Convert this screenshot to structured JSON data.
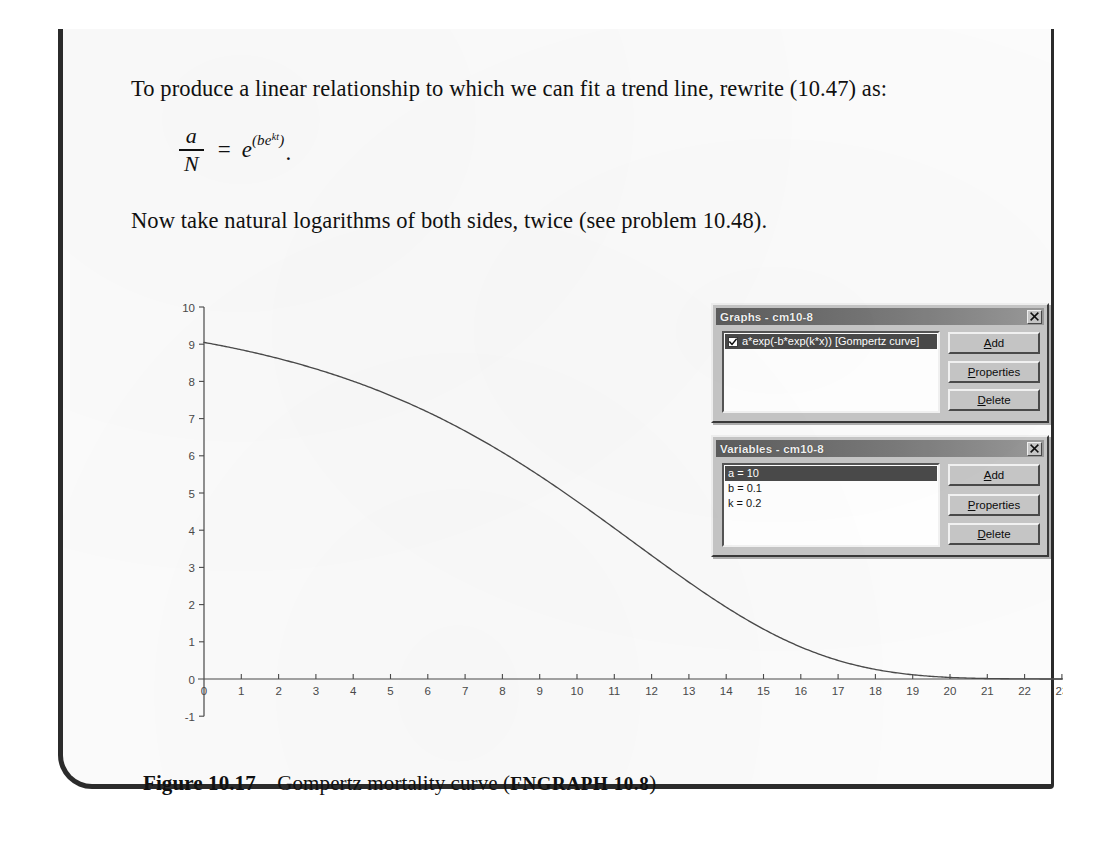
{
  "document": {
    "intro_text": "To produce a linear relationship to which we can fit a trend line, rewrite (10.47) as:",
    "post_text": "Now take natural logarithms of both sides, twice (see problem 10.48).",
    "equation": {
      "numerator": "a",
      "denominator": "N",
      "equals": "=",
      "base": "e",
      "exponent_open": "(",
      "exponent_body": "be",
      "exponent_inner": "kt",
      "exponent_close": ")",
      "period": "."
    },
    "caption": {
      "number": "Figure 10.17",
      "title": "Gompertz mortality curve",
      "open_paren": "(",
      "source": "FNGRAPH 10.8",
      "close_paren": ")"
    }
  },
  "graphs_dialog": {
    "title": "Graphs - cm10-8",
    "close_label": "Close",
    "items": [
      {
        "label": "a*exp(-b*exp(k*x)) [Gompertz curve]",
        "checked": true,
        "selected": true
      }
    ],
    "buttons": [
      {
        "mnemonic": "A",
        "rest": "dd"
      },
      {
        "mnemonic": "P",
        "rest": "roperties"
      },
      {
        "mnemonic": "D",
        "rest": "elete"
      }
    ]
  },
  "variables_dialog": {
    "title": "Variables - cm10-8",
    "close_label": "Close",
    "items": [
      {
        "label": "a = 10",
        "selected": true
      },
      {
        "label": "b = 0.1",
        "selected": false
      },
      {
        "label": "k = 0.2",
        "selected": false
      }
    ],
    "buttons": [
      {
        "mnemonic": "A",
        "rest": "dd"
      },
      {
        "mnemonic": "P",
        "rest": "roperties"
      },
      {
        "mnemonic": "D",
        "rest": "elete"
      }
    ]
  },
  "chart_data": {
    "type": "line",
    "title": "Gompertz mortality curve",
    "xlabel": "",
    "ylabel": "",
    "grid": false,
    "legend": "none",
    "equation": "a*exp(-b*exp(k*x))",
    "parameters": {
      "a": 10,
      "b": 0.1,
      "k": 0.2
    },
    "xlim": [
      0,
      23
    ],
    "ylim": [
      -1,
      10
    ],
    "xticks": [
      0,
      1,
      2,
      3,
      4,
      5,
      6,
      7,
      8,
      9,
      10,
      11,
      12,
      13,
      14,
      15,
      16,
      17,
      18,
      19,
      20,
      21,
      22,
      23
    ],
    "yticks": [
      -1,
      0,
      1,
      2,
      3,
      4,
      5,
      6,
      7,
      8,
      9,
      10
    ],
    "x": [
      0,
      1,
      2,
      3,
      4,
      5,
      6,
      7,
      8,
      9,
      10,
      11,
      12,
      13,
      14,
      15,
      16,
      17,
      18,
      19,
      20,
      21,
      22,
      23
    ],
    "y": [
      9.05,
      8.84,
      8.6,
      8.3,
      7.95,
      7.53,
      7.04,
      6.47,
      5.82,
      5.1,
      4.33,
      3.53,
      2.75,
      2.02,
      1.39,
      0.88,
      0.5,
      0.25,
      0.11,
      0.04,
      0.01,
      0.002,
      0.0003,
      2e-05
    ],
    "series": [
      {
        "name": "a*exp(-b*exp(k*x)) [Gompertz curve]",
        "color": "#4a4a4a",
        "values": [
          9.05,
          8.84,
          8.6,
          8.3,
          7.95,
          7.53,
          7.04,
          6.47,
          5.82,
          5.1,
          4.33,
          3.53,
          2.75,
          2.02,
          1.39,
          0.88,
          0.5,
          0.25,
          0.11,
          0.04,
          0.01,
          0.002,
          0.0003,
          2e-05
        ]
      }
    ]
  },
  "colors": {
    "axis": "#4a4a4a",
    "curve": "#4a4a4a",
    "page_border": "#2b2b2b",
    "dialog_face": "#c6c6c6",
    "dialog_titlebar": "#6e6e6e",
    "selection": "#4a4a4a",
    "paper": "#fbfbfb"
  }
}
